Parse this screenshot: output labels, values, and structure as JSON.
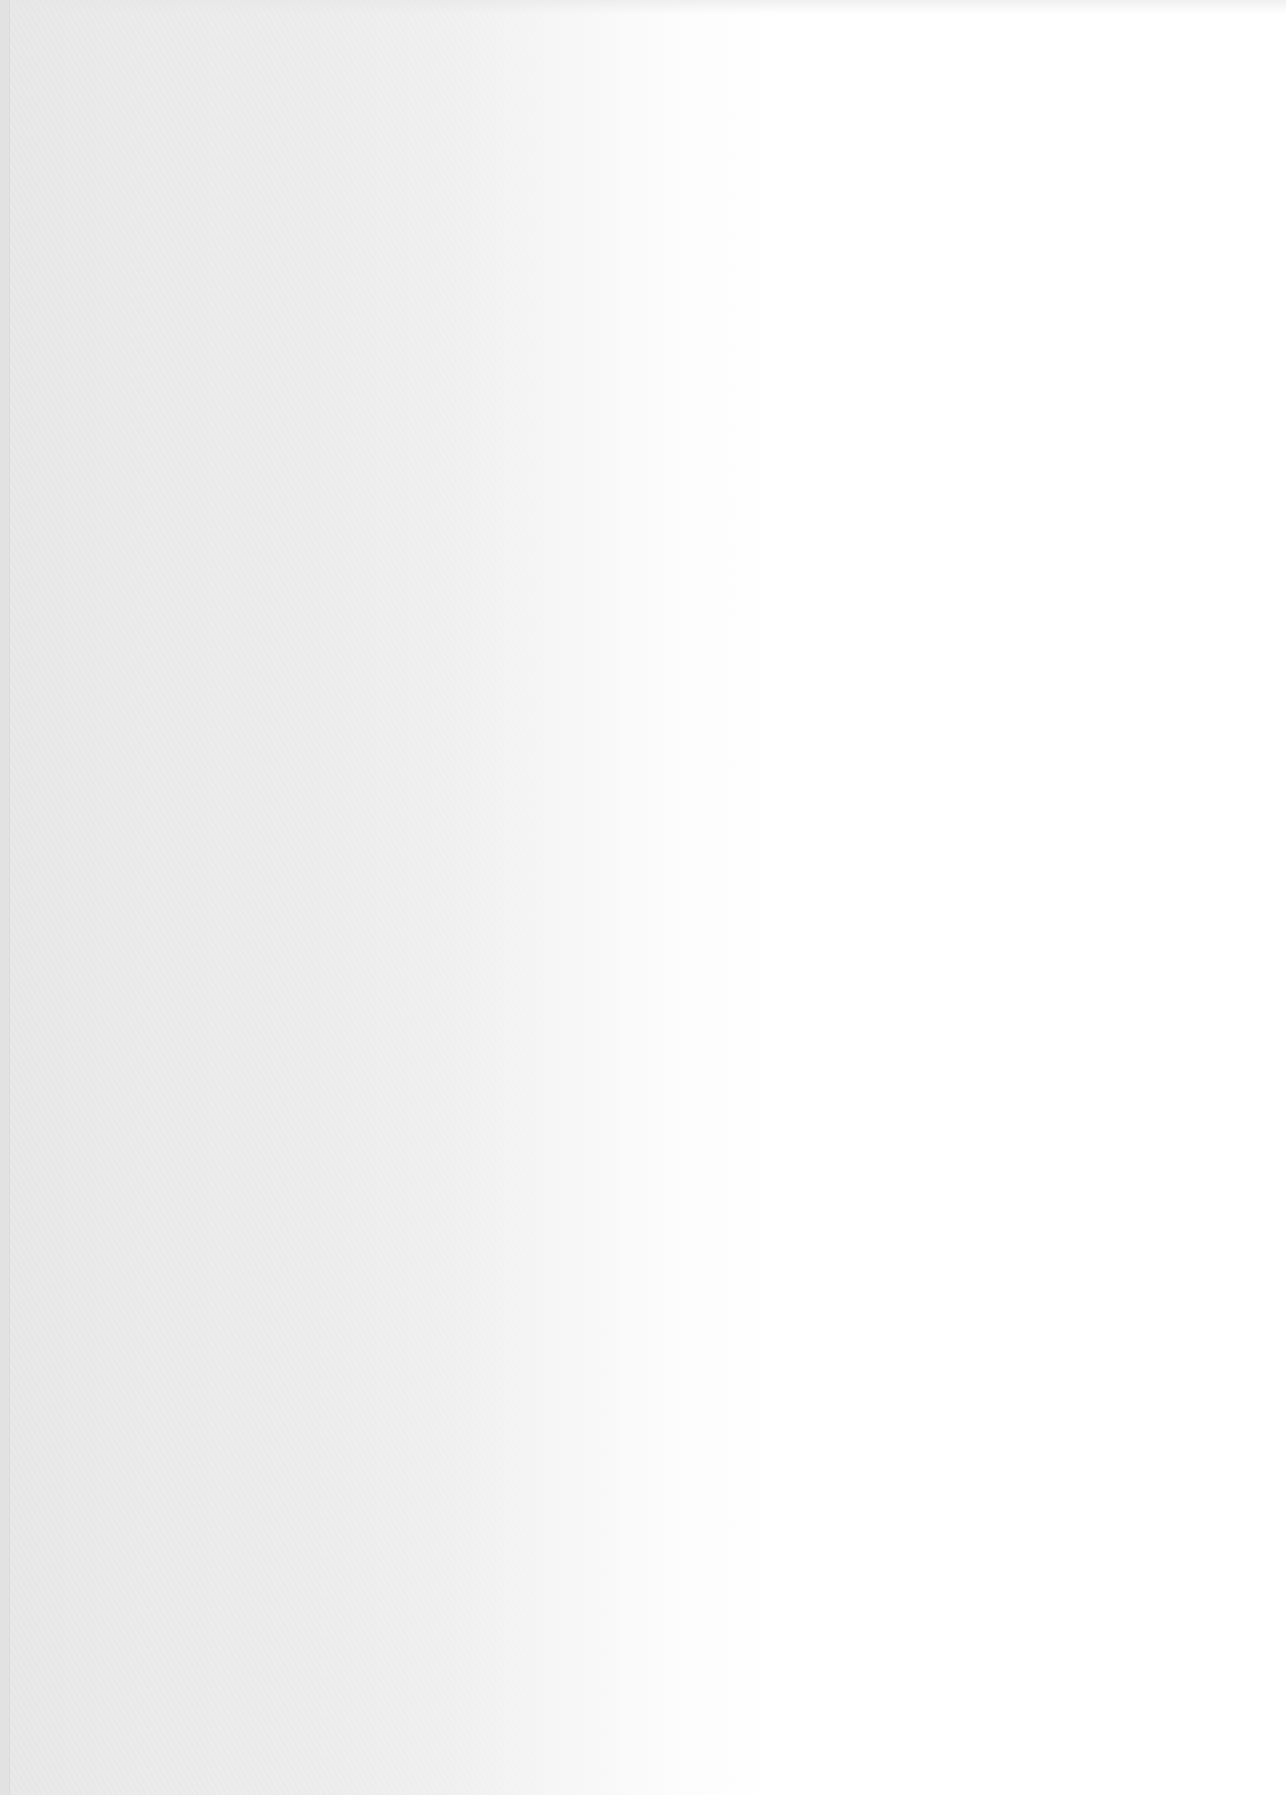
{
  "page": {
    "type": "blank scanned paper page",
    "text_content": "",
    "has_visible_text": false,
    "colors": {
      "left_shade": "#e6e6e6",
      "mid_shade": "#efefef",
      "right_paper": "#ffffff",
      "edge_strip": "#e2e2e2"
    }
  }
}
